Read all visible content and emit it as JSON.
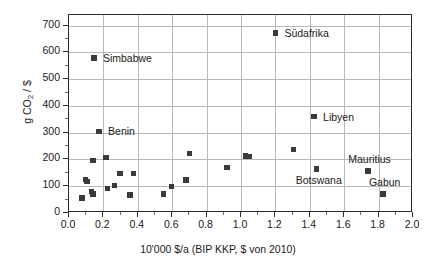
{
  "chart_data": {
    "type": "scatter",
    "title": "",
    "xlabel": "10'000 $/a (BIP KKP, $ von 2010)",
    "ylabel": "g CO2 / $",
    "ylabel_pre": "g CO",
    "ylabel_sub": "2",
    "ylabel_post": " / $",
    "xlim": [
      0.0,
      2.0
    ],
    "ylim": [
      0,
      740
    ],
    "grid": true,
    "legend": "none",
    "xticks": [
      "0.0",
      "0.2",
      "0.4",
      "0.6",
      "0.8",
      "1.0",
      "1.2",
      "1.4",
      "1.6",
      "1.8",
      "2.0"
    ],
    "xtick_values": [
      0.0,
      0.2,
      0.4,
      0.6,
      0.8,
      1.0,
      1.2,
      1.4,
      1.6,
      1.8,
      2.0
    ],
    "xminor_values": [
      0.1,
      0.3,
      0.5,
      0.7,
      0.9,
      1.1,
      1.3,
      1.5,
      1.7,
      1.9
    ],
    "yticks": [
      "0",
      "100",
      "200",
      "300",
      "400",
      "500",
      "600",
      "700"
    ],
    "ytick_values": [
      0,
      100,
      200,
      300,
      400,
      500,
      600,
      700
    ],
    "yminor_values": [
      50,
      150,
      250,
      350,
      450,
      550,
      650
    ],
    "marker_color": "#3a3a3a",
    "grid_color": "#b8b8b8",
    "frame_color": "#2b2b2b",
    "points": [
      {
        "x": 0.075,
        "y": 57,
        "label": ""
      },
      {
        "x": 0.095,
        "y": 125,
        "label": ""
      },
      {
        "x": 0.105,
        "y": 118,
        "label": ""
      },
      {
        "x": 0.13,
        "y": 80,
        "label": ""
      },
      {
        "x": 0.14,
        "y": 72,
        "label": ""
      },
      {
        "x": 0.14,
        "y": 196,
        "label": ""
      },
      {
        "x": 0.145,
        "y": 580,
        "label": "Simbabwe",
        "label_dx": 9,
        "label_dy": -5
      },
      {
        "x": 0.175,
        "y": 305,
        "label": "Benin",
        "label_dx": 9,
        "label_dy": -5
      },
      {
        "x": 0.215,
        "y": 208,
        "label": ""
      },
      {
        "x": 0.225,
        "y": 92,
        "label": ""
      },
      {
        "x": 0.265,
        "y": 103,
        "label": ""
      },
      {
        "x": 0.295,
        "y": 147,
        "label": ""
      },
      {
        "x": 0.355,
        "y": 68,
        "label": ""
      },
      {
        "x": 0.375,
        "y": 148,
        "label": ""
      },
      {
        "x": 0.55,
        "y": 70,
        "label": ""
      },
      {
        "x": 0.595,
        "y": 99,
        "label": ""
      },
      {
        "x": 0.68,
        "y": 123,
        "label": ""
      },
      {
        "x": 0.7,
        "y": 223,
        "label": ""
      },
      {
        "x": 0.92,
        "y": 170,
        "label": ""
      },
      {
        "x": 1.025,
        "y": 214,
        "label": ""
      },
      {
        "x": 1.045,
        "y": 211,
        "label": ""
      },
      {
        "x": 1.2,
        "y": 673,
        "label": "Südafrika",
        "label_dx": 9,
        "label_dy": -5
      },
      {
        "x": 1.305,
        "y": 237,
        "label": ""
      },
      {
        "x": 1.425,
        "y": 360,
        "label": "Libyen",
        "label_dx": 9,
        "label_dy": -5
      },
      {
        "x": 1.44,
        "y": 165,
        "label": "Botswana",
        "label_dx": -21,
        "label_dy": 6
      },
      {
        "x": 1.74,
        "y": 157,
        "label": "Mauritius",
        "label_dx": -20,
        "label_dy": -17
      },
      {
        "x": 1.825,
        "y": 72,
        "label": "Gabun",
        "label_dx": -14,
        "label_dy": -17
      }
    ]
  }
}
